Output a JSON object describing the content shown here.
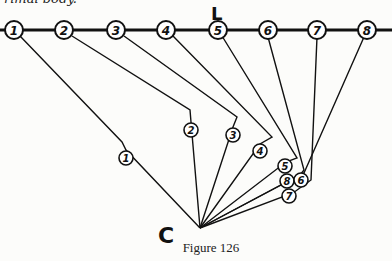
{
  "top_text": "rimal body.",
  "line_label": "L",
  "center_label": "C",
  "caption": "Figure 126",
  "top_points": [
    {
      "n": "1",
      "x": 14,
      "y": 30
    },
    {
      "n": "2",
      "x": 64,
      "y": 30
    },
    {
      "n": "3",
      "x": 116,
      "y": 30
    },
    {
      "n": "4",
      "x": 166,
      "y": 30
    },
    {
      "n": "5",
      "x": 218,
      "y": 30
    },
    {
      "n": "6",
      "x": 268,
      "y": 30
    },
    {
      "n": "7",
      "x": 317,
      "y": 30
    },
    {
      "n": "8",
      "x": 367,
      "y": 30
    }
  ],
  "lower_points": [
    {
      "n": "1",
      "x": 126,
      "y": 158
    },
    {
      "n": "2",
      "x": 191,
      "y": 130
    },
    {
      "n": "3",
      "x": 233,
      "y": 135
    },
    {
      "n": "4",
      "x": 260,
      "y": 151
    },
    {
      "n": "5",
      "x": 286,
      "y": 167
    },
    {
      "n": "6",
      "x": 300,
      "y": 180
    },
    {
      "n": "7",
      "x": 289,
      "y": 196
    },
    {
      "n": "8",
      "x": 286,
      "y": 180
    }
  ],
  "colors": {
    "ink": "#111111",
    "paper": "#fcfcfa"
  }
}
